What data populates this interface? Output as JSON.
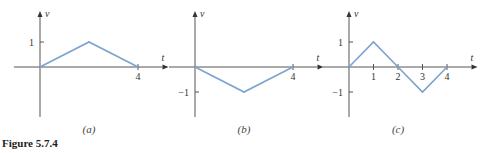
{
  "figure_caption": "Figure 5.7.4",
  "colors": {
    "series": "#7aa3cf",
    "axis": "#555555"
  },
  "chart_data": [
    {
      "type": "line",
      "caption": "(a)",
      "xlabel": "t",
      "ylabel": "v",
      "x": [
        0,
        2,
        4
      ],
      "y": [
        0,
        1,
        0
      ],
      "xlim": [
        0,
        5
      ],
      "ylim": [
        -2,
        2
      ],
      "xticks": [
        4
      ],
      "xtick_labels": [
        "4"
      ],
      "yticks": [
        1
      ],
      "ytick_labels": [
        "1"
      ],
      "grid": false
    },
    {
      "type": "line",
      "caption": "(b)",
      "xlabel": "t",
      "ylabel": "v",
      "x": [
        0,
        2,
        4
      ],
      "y": [
        0,
        -1,
        0
      ],
      "xlim": [
        0,
        5
      ],
      "ylim": [
        -2,
        2
      ],
      "xticks": [
        4
      ],
      "xtick_labels": [
        "4"
      ],
      "yticks": [
        -1
      ],
      "ytick_labels": [
        "−1"
      ],
      "grid": false
    },
    {
      "type": "line",
      "caption": "(c)",
      "xlabel": "t",
      "ylabel": "v",
      "x": [
        0,
        1,
        2,
        3,
        4
      ],
      "y": [
        0,
        1,
        0,
        -1,
        0
      ],
      "xlim": [
        0,
        5
      ],
      "ylim": [
        -2,
        2
      ],
      "xticks": [
        1,
        2,
        3,
        4
      ],
      "xtick_labels": [
        "1",
        "2",
        "3",
        "4"
      ],
      "yticks": [
        1,
        -1
      ],
      "ytick_labels": [
        "1",
        "−1"
      ],
      "grid": false
    }
  ]
}
